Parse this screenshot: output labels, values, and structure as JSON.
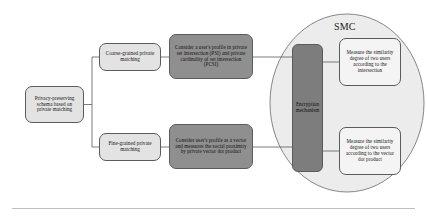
{
  "figure": {
    "background_color": "#ffffff"
  },
  "colors": {
    "node_light_fill": "#e3e3e3",
    "node_dark_fill": "#8f8f8f",
    "node_white_fill": "#f4f4f4",
    "encryption_fill": "#7d7d7d",
    "ellipse_fill": "#ececec",
    "stroke": "#5b5b5b",
    "text": "#141414",
    "rule": "#b5b5b5"
  },
  "nodes": {
    "root": {
      "label": "Privacy-preserving schema based on private matching",
      "fill": "#e3e3e3"
    },
    "coarse": {
      "label": "Coarse-grained private matching",
      "fill": "#e3e3e3"
    },
    "fine": {
      "label": "Fine-grained private matching",
      "fill": "#e3e3e3"
    },
    "psi": {
      "label": "Consider a user's profile in private set intersection (PSI) and private cardinality of set intersection (PCSI)",
      "fill": "#8f8f8f"
    },
    "vector": {
      "label": "Consider user's profile as a vector and measures the social proximity by private vector dot product",
      "fill": "#8f8f8f"
    },
    "encryption": {
      "label": "Encryption mechanism",
      "fill": "#7d7d7d"
    },
    "measure_intersection": {
      "label": "Measure the similarity degree of two users according to the intersection",
      "fill": "#f4f4f4"
    },
    "measure_dot": {
      "label": "Measure the similarity degree of two users according to the vector dot product",
      "fill": "#f4f4f4"
    }
  },
  "groups": {
    "smc": {
      "label": "SMC",
      "shape": "ellipse"
    }
  },
  "connectors": [
    {
      "from": "root",
      "to": "coarse"
    },
    {
      "from": "root",
      "to": "fine"
    },
    {
      "from": "coarse",
      "to": "psi"
    },
    {
      "from": "fine",
      "to": "vector"
    },
    {
      "from": "psi",
      "to": "encryption"
    },
    {
      "from": "vector",
      "to": "encryption"
    },
    {
      "from": "encryption",
      "to": "measure_intersection"
    },
    {
      "from": "encryption",
      "to": "measure_dot"
    }
  ]
}
